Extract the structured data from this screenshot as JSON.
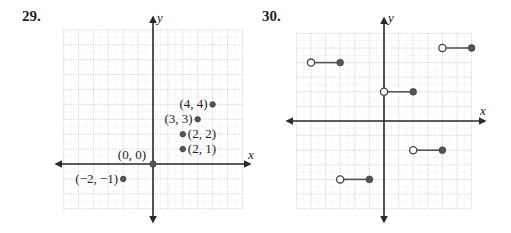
{
  "problems": [
    {
      "number": "29."
    },
    {
      "number": "30."
    }
  ],
  "chart_data": [
    {
      "type": "scatter",
      "title": "29.",
      "xlabel": "x",
      "ylabel": "y",
      "xlim": [
        -6,
        6
      ],
      "ylim": [
        -3,
        9
      ],
      "grid": true,
      "points": [
        {
          "x": 0,
          "y": 0,
          "label": "(0, 0)"
        },
        {
          "x": 2,
          "y": 1,
          "label": "(2, 1)"
        },
        {
          "x": 2,
          "y": 2,
          "label": "(2, 2)"
        },
        {
          "x": 3,
          "y": 3,
          "label": "(3, 3)"
        },
        {
          "x": 4,
          "y": 4,
          "label": "(4, 4)"
        },
        {
          "x": -2,
          "y": -1,
          "label": "(−2, −1)"
        }
      ]
    },
    {
      "type": "line",
      "title": "30.",
      "xlabel": "x",
      "ylabel": "y",
      "xlim": [
        -6,
        6
      ],
      "ylim": [
        -6,
        6
      ],
      "grid": true,
      "segments": [
        {
          "x_open": -5,
          "x_closed": -3,
          "y": 4
        },
        {
          "x_open": -3,
          "x_closed": -1,
          "y": -4
        },
        {
          "x_open": 0,
          "x_closed": 2,
          "y": 2
        },
        {
          "x_open": 2,
          "x_closed": 4,
          "y": -2
        },
        {
          "x_open": 4,
          "x_closed": 6,
          "y": 5
        }
      ]
    }
  ],
  "colors": {
    "axis": "#2a2a2a",
    "point": "#555555",
    "grid": "#c8c8c8"
  }
}
